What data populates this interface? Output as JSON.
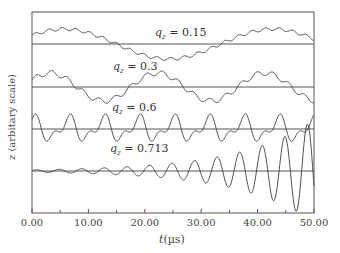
{
  "chart_data": {
    "type": "line",
    "title": "",
    "xlabel": "t(µs)",
    "xlabel_var": "t",
    "xlabel_unit": "(µs)",
    "ylabel": "z (arbitary scale)",
    "ylabel_var": "z",
    "ylabel_rest": " (arbitary scale)",
    "xlim": [
      0,
      50
    ],
    "x_ticks": [
      "0.00",
      "10.00",
      "20.00",
      "30.00",
      "40.00",
      "50.00"
    ],
    "x_minor_ticks": [
      5,
      15,
      25,
      35,
      45
    ],
    "grid": false,
    "legend": "inline labels above each trace",
    "series": [
      {
        "name": "q_z = 0.15",
        "label_var": "q",
        "label_sub": "z",
        "label_val": " = 0.15",
        "baseline_px": 44,
        "description": "Slow oscillation, period ~37 µs, with small superimposed micromotion ripple",
        "amplitude_px": 15,
        "period_us": 37,
        "phase": 0.6,
        "micro_amp": 1.5,
        "micro_period_us": 2.4,
        "growth": 0
      },
      {
        "name": "q_z = 0.3",
        "label_var": "q",
        "label_sub": "z",
        "label_val": " = 0.3",
        "baseline_px": 87,
        "description": "Oscillation with period ~19 µs and micromotion ripple",
        "amplitude_px": 14,
        "period_us": 19,
        "phase": 0.5,
        "micro_amp": 2.5,
        "micro_period_us": 2.8,
        "growth": 0
      },
      {
        "name": "q_z = 0.6",
        "label_var": "q",
        "label_sub": "z",
        "label_val": " = 0.6",
        "baseline_px": 129,
        "description": "Oscillation with period ~6 µs, distorted by strong micromotion",
        "amplitude_px": 10,
        "period_us": 6.2,
        "phase": 1.3,
        "micro_amp": 6,
        "micro_period_us": 3.1,
        "growth": 0
      },
      {
        "name": "q_z = 0.713",
        "label_var": "q",
        "label_sub": "z",
        "label_val": " = 0.713",
        "baseline_px": 171,
        "description": "Unstable, exponentially growing oscillation with period ~4 µs",
        "amplitude_px": 1.2,
        "period_us": 4.0,
        "phase": 0.3,
        "micro_amp": 0,
        "micro_period_us": 1,
        "growth": 0.075
      }
    ]
  },
  "colors": {
    "line": "#3a3a3a",
    "axis": "#555555",
    "baseline": "#555555",
    "text": "#444444"
  }
}
